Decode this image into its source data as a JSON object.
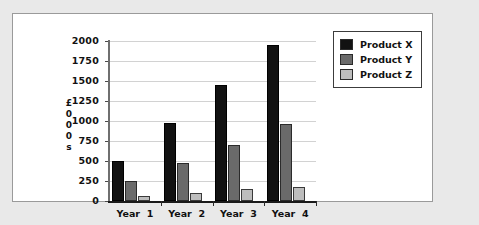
{
  "chart_data": {
    "type": "bar",
    "title": "",
    "xlabel": "",
    "ylabel": "£000s",
    "ylabel_stacked": [
      "£",
      "0",
      "0",
      "0",
      "s"
    ],
    "categories": [
      "Year  1",
      "Year  2",
      "Year  3",
      "Year  4"
    ],
    "series": [
      {
        "name": "Product X",
        "color": "#121212",
        "values": [
          500,
          975,
          1450,
          1950
        ]
      },
      {
        "name": "Product Y",
        "color": "#6a6a6a",
        "values": [
          250,
          475,
          700,
          960
        ]
      },
      {
        "name": "Product Z",
        "color": "#bdbdbd",
        "values": [
          65,
          105,
          150,
          175
        ]
      }
    ],
    "ylim": [
      0,
      2000
    ],
    "ytick_labels": [
      "2000",
      "1750",
      "1500",
      "1250",
      "1000",
      "750",
      "500",
      "250",
      "0"
    ],
    "ytick_values": [
      2000,
      1750,
      1500,
      1250,
      1000,
      750,
      500,
      250,
      0
    ],
    "grid": true,
    "grid_axis": "y",
    "legend_position": "top-right",
    "legend_entries": [
      "Product X",
      "Product Y",
      "Product Z"
    ],
    "background_color": "#ffffff",
    "page_background_color": "#e9e9e9",
    "frame_border_color": "#9a9a9a"
  }
}
